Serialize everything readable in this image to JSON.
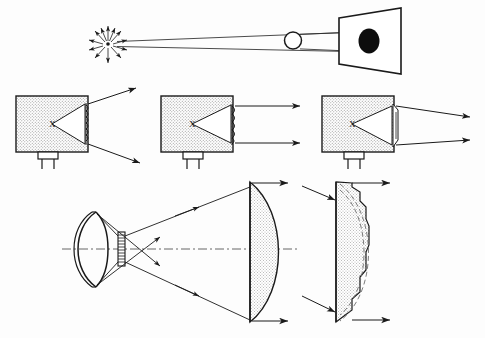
{
  "figure": {
    "width": 485,
    "height": 338,
    "background_color": "#fdfdfd",
    "ink_color": "#1a1a1a",
    "hatch_color": "#9a9a9a",
    "panels": [
      {
        "id": "top-beam",
        "name": "point-source-beam-panel",
        "caption": "",
        "elements": [
          {
            "name": "point-light-source",
            "type": "starburst",
            "rays": 12,
            "center_x": 108,
            "center_y": 44,
            "radius": 18
          },
          {
            "name": "beam-upper-edge",
            "type": "ray",
            "x1": 117,
            "y1": 42,
            "x2": 375,
            "y2": 31
          },
          {
            "name": "beam-lower-edge",
            "type": "ray",
            "x1": 117,
            "y1": 47,
            "x2": 375,
            "y2": 52
          },
          {
            "name": "aperture-sphere",
            "type": "circle-open",
            "cx": 293,
            "cy": 40,
            "r": 9
          },
          {
            "name": "projected-spot",
            "type": "ellipse-filled",
            "cx": 370,
            "cy": 41,
            "rx": 11,
            "ry": 13
          },
          {
            "name": "projection-screen",
            "type": "trapezoid-screen"
          }
        ]
      },
      {
        "id": "lamp-row",
        "name": "lamp-housing-row",
        "caption": "",
        "lamps": [
          {
            "name": "lamp-wide-beam",
            "housing_x": 16,
            "housing_y": 96,
            "housing_w": 72,
            "housing_h": 56,
            "filament_label": "X",
            "lens_type": "ridged-fresnel-face",
            "beam": "diverging",
            "ray_count": 2
          },
          {
            "name": "lamp-parallel-beam",
            "housing_x": 161,
            "housing_y": 96,
            "housing_w": 72,
            "housing_h": 56,
            "filament_label": "X",
            "lens_type": "bulged-fresnel-face",
            "beam": "parallel",
            "ray_count": 2
          },
          {
            "name": "lamp-converging-beam",
            "housing_x": 322,
            "housing_y": 96,
            "housing_w": 72,
            "housing_h": 56,
            "filament_label": "X",
            "lens_type": "narrow-stepped-lens",
            "beam": "converging-then-diverging",
            "ray_count": 2
          }
        ]
      },
      {
        "id": "reflector-lens-system",
        "name": "spherical-mirror-and-plano-convex-lens-panel",
        "caption": "",
        "elements": [
          {
            "name": "spherical-reflector-mirror",
            "type": "double-arc-concave-mirror"
          },
          {
            "name": "filament-source",
            "type": "hatched-bar",
            "x": 118,
            "y": 232,
            "w": 7,
            "h": 34
          },
          {
            "name": "optical-axis",
            "type": "dash-dot-axis",
            "y": 249
          },
          {
            "name": "plano-convex-lens",
            "type": "plano-convex",
            "flat_x": 250,
            "bulge_to_x": 283
          },
          {
            "name": "output-ray-top",
            "type": "arrow",
            "direction": "right"
          },
          {
            "name": "output-ray-bottom",
            "type": "arrow",
            "direction": "right"
          }
        ]
      },
      {
        "id": "fresnel-construction",
        "name": "fresnel-lens-panel",
        "caption": "",
        "elements": [
          {
            "name": "fresnel-lens",
            "type": "stepped-fresnel",
            "flat_x": 336,
            "steps": 8
          },
          {
            "name": "original-lens-profile-outer",
            "type": "dashed-arc"
          },
          {
            "name": "original-lens-profile-inner",
            "type": "dashed-arc"
          },
          {
            "name": "incoming-ray-upper",
            "type": "arrow",
            "direction": "down-right"
          },
          {
            "name": "incoming-ray-lower",
            "type": "arrow",
            "direction": "down-right"
          },
          {
            "name": "outgoing-ray-upper",
            "type": "arrow",
            "direction": "right"
          },
          {
            "name": "outgoing-ray-lower",
            "type": "arrow",
            "direction": "right"
          }
        ]
      }
    ]
  }
}
